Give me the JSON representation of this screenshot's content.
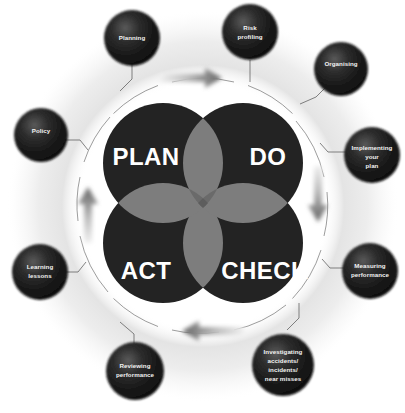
{
  "diagram": {
    "type": "cycle-venn",
    "flow_direction": "clockwise",
    "colors": {
      "quadrant_fill": "#232323",
      "lens_fill": "#7d7d7d",
      "lens_center_fill": "#5d5d5d",
      "node_fill": "#1c1c1c",
      "node_highlight": "#4e4e4e",
      "halo_ring": "#ededed",
      "arrow_dark": "#6e6e6e",
      "arrow_light": "#e2e2e2",
      "label_text": "#f2f2f2",
      "quadrant_text": "#ffffff",
      "background": "#ffffff"
    },
    "quadrants": [
      {
        "id": "plan",
        "label": "PLAN",
        "position": "top-left"
      },
      {
        "id": "do",
        "label": "DO",
        "position": "top-right"
      },
      {
        "id": "act",
        "label": "ACT",
        "position": "bottom-left"
      },
      {
        "id": "check",
        "label": "CHECK",
        "position": "bottom-right"
      }
    ],
    "arrows": [
      {
        "id": "arrow-top",
        "direction": "right",
        "position": "top"
      },
      {
        "id": "arrow-right",
        "direction": "down",
        "position": "right"
      },
      {
        "id": "arrow-bottom",
        "direction": "left",
        "position": "bottom"
      },
      {
        "id": "arrow-left",
        "direction": "up",
        "position": "left"
      }
    ],
    "nodes": [
      {
        "id": "planning",
        "lines": [
          "Planning"
        ],
        "related_quadrant": "plan"
      },
      {
        "id": "risk-profiling",
        "lines": [
          "Risk",
          "profiling"
        ],
        "related_quadrant": "plan"
      },
      {
        "id": "organising",
        "lines": [
          "Organising"
        ],
        "related_quadrant": "do"
      },
      {
        "id": "implementing",
        "lines": [
          "Implementing",
          "your",
          "plan"
        ],
        "related_quadrant": "do"
      },
      {
        "id": "measuring",
        "lines": [
          "Measuring",
          "performance"
        ],
        "related_quadrant": "check"
      },
      {
        "id": "investigating",
        "lines": [
          "Investigating",
          "accidents/",
          "incidents/",
          "near misses"
        ],
        "related_quadrant": "check"
      },
      {
        "id": "reviewing",
        "lines": [
          "Reviewing",
          "performance"
        ],
        "related_quadrant": "act"
      },
      {
        "id": "learning",
        "lines": [
          "Learning",
          "lessons"
        ],
        "related_quadrant": "act"
      },
      {
        "id": "policy",
        "lines": [
          "Policy"
        ],
        "related_quadrant": "plan"
      }
    ]
  }
}
